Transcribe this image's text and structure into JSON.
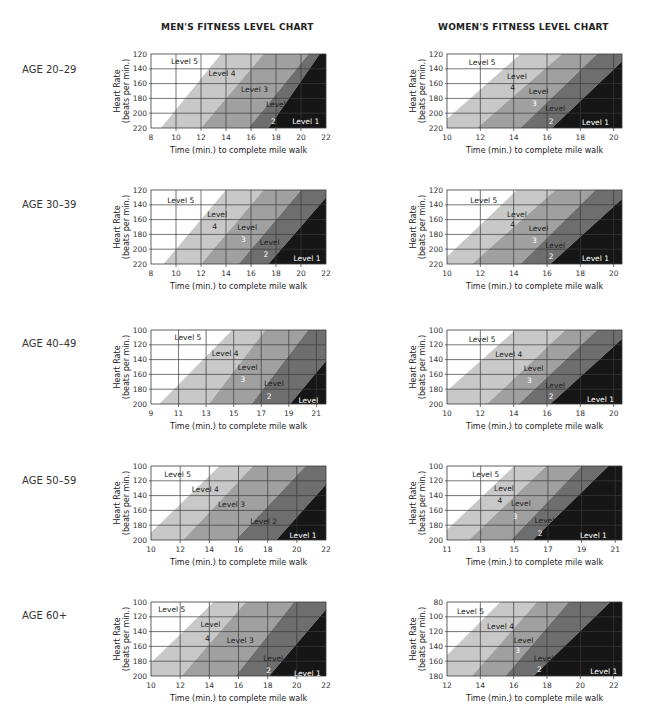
{
  "titles": {
    "men": "MEN'S FITNESS LEVEL CHART",
    "women": "WOMEN'S FITNESS LEVEL CHART"
  },
  "ages": [
    "AGE 20–29",
    "AGE 30–39",
    "AGE 40–49",
    "AGE 50–59",
    "AGE 60+"
  ],
  "axis": {
    "ylabel1": "Heart Rate",
    "ylabel2": "(beats per min.)",
    "xlabel": "Time (min.) to complete mile walk"
  },
  "colors": {
    "level5": "#ffffff",
    "level4": "#c8c8c8",
    "level3": "#a0a0a0",
    "level2": "#6e6e6e",
    "level1": "#161616",
    "grid": "#3a3a3a"
  },
  "chart_data": [
    {
      "id": "men-20-29",
      "group": "men",
      "age": "AGE 20–29",
      "type": "area",
      "title": "MEN'S FITNESS LEVEL CHART",
      "xlabel": "Time (min.) to complete mile walk",
      "ylabel": "Heart Rate (beats per min.)",
      "xticks": [
        8,
        10,
        12,
        14,
        16,
        18,
        20,
        22
      ],
      "yticks": [
        120,
        140,
        160,
        180,
        200,
        220
      ],
      "xlim": [
        8,
        22
      ],
      "ylim": [
        120,
        220
      ],
      "boundaries": [
        [
          [
            8.8,
            220
          ],
          [
            13.6,
            120
          ]
        ],
        [
          [
            12,
            220
          ],
          [
            17,
            120
          ]
        ],
        [
          [
            15.8,
            220
          ],
          [
            20.6,
            120
          ]
        ],
        [
          [
            17.4,
            220
          ],
          [
            21.5,
            120
          ]
        ]
      ],
      "labels": [
        {
          "text": "Level 5",
          "x": 9.6,
          "y": 130
        },
        {
          "text": "Level 4",
          "x": 12.6,
          "y": 145
        },
        {
          "text": "Level 3",
          "x": 15.2,
          "y": 167
        },
        {
          "text": "Level",
          "x": 17.2,
          "y": 188
        },
        {
          "text": "2",
          "x": 17.6,
          "y": 210
        },
        {
          "text": "Level 1",
          "x": 19.3,
          "y": 210,
          "light": true
        }
      ]
    },
    {
      "id": "women-20-29",
      "group": "women",
      "age": "AGE 20–29",
      "type": "area",
      "title": "WOMEN'S FITNESS LEVEL CHART",
      "xlabel": "Time (min.) to complete mile walk",
      "ylabel": "Heart Rate (beats per min.)",
      "xticks": [
        10,
        12,
        14,
        16,
        18,
        20
      ],
      "yticks": [
        120,
        140,
        160,
        180,
        200,
        220
      ],
      "xlim": [
        10,
        20.5
      ],
      "ylim": [
        120,
        220
      ],
      "boundaries": [
        [
          [
            10,
            208
          ],
          [
            14.4,
            120
          ]
        ],
        [
          [
            11.8,
            220
          ],
          [
            16.9,
            120
          ]
        ],
        [
          [
            14.4,
            220
          ],
          [
            19,
            120
          ]
        ],
        [
          [
            16.3,
            220
          ],
          [
            20.5,
            130
          ]
        ]
      ],
      "labels": [
        {
          "text": "Level 5",
          "x": 11.3,
          "y": 131
        },
        {
          "text": "Level",
          "x": 13.6,
          "y": 150
        },
        {
          "text": "4",
          "x": 13.8,
          "y": 164
        },
        {
          "text": "Level",
          "x": 14.9,
          "y": 170
        },
        {
          "text": "3",
          "x": 15.1,
          "y": 186
        },
        {
          "text": "Level",
          "x": 15.9,
          "y": 193
        },
        {
          "text": "2",
          "x": 16.1,
          "y": 210
        },
        {
          "text": "Level 1",
          "x": 18.1,
          "y": 212,
          "light": true
        }
      ]
    },
    {
      "id": "men-30-39",
      "group": "men",
      "age": "AGE 30–39",
      "type": "area",
      "xticks": [
        8,
        10,
        12,
        14,
        16,
        18,
        20,
        22
      ],
      "yticks": [
        120,
        140,
        160,
        180,
        200,
        220
      ],
      "xlim": [
        8,
        22
      ],
      "ylim": [
        120,
        220
      ],
      "boundaries": [
        [
          [
            9,
            220
          ],
          [
            14,
            120
          ]
        ],
        [
          [
            12,
            220
          ],
          [
            17,
            120
          ]
        ],
        [
          [
            15,
            220
          ],
          [
            20,
            120
          ]
        ],
        [
          [
            17.4,
            220
          ],
          [
            22,
            130
          ]
        ]
      ],
      "labels": [
        {
          "text": "Level 5",
          "x": 9.3,
          "y": 133
        },
        {
          "text": "Level",
          "x": 12.5,
          "y": 152
        },
        {
          "text": "4",
          "x": 12.9,
          "y": 168
        },
        {
          "text": "Level",
          "x": 14.9,
          "y": 170
        },
        {
          "text": "3",
          "x": 15.2,
          "y": 186
        },
        {
          "text": "Level",
          "x": 16.7,
          "y": 190
        },
        {
          "text": "2",
          "x": 17,
          "y": 207
        },
        {
          "text": "Level 1",
          "x": 19.4,
          "y": 212,
          "light": true
        }
      ]
    },
    {
      "id": "women-30-39",
      "group": "women",
      "age": "AGE 30–39",
      "type": "area",
      "xticks": [
        10,
        12,
        14,
        16,
        18,
        20
      ],
      "yticks": [
        120,
        140,
        160,
        180,
        200,
        220
      ],
      "xlim": [
        10,
        20.5
      ],
      "ylim": [
        120,
        220
      ],
      "boundaries": [
        [
          [
            10,
            210
          ],
          [
            14.2,
            120
          ]
        ],
        [
          [
            11.5,
            220
          ],
          [
            16.5,
            120
          ]
        ],
        [
          [
            14.4,
            220
          ],
          [
            18.9,
            120
          ]
        ],
        [
          [
            16.2,
            220
          ],
          [
            20.5,
            132
          ]
        ]
      ],
      "labels": [
        {
          "text": "Level 5",
          "x": 11.4,
          "y": 133
        },
        {
          "text": "Level",
          "x": 13.6,
          "y": 152
        },
        {
          "text": "4",
          "x": 13.8,
          "y": 166
        },
        {
          "text": "Level",
          "x": 14.9,
          "y": 172
        },
        {
          "text": "3",
          "x": 15.1,
          "y": 188
        },
        {
          "text": "Level",
          "x": 15.9,
          "y": 194
        },
        {
          "text": "2",
          "x": 16.1,
          "y": 209
        },
        {
          "text": "Level 1",
          "x": 18.1,
          "y": 212,
          "light": true
        }
      ]
    },
    {
      "id": "men-40-49",
      "group": "men",
      "age": "AGE 40–49",
      "type": "area",
      "xticks": [
        9,
        11,
        13,
        15,
        17,
        19,
        21
      ],
      "yticks": [
        100,
        120,
        140,
        160,
        180,
        200
      ],
      "xlim": [
        9,
        21.7
      ],
      "ylim": [
        100,
        200
      ],
      "boundaries": [
        [
          [
            9.6,
            200
          ],
          [
            14.9,
            100
          ]
        ],
        [
          [
            13.2,
            200
          ],
          [
            17.3,
            100
          ]
        ],
        [
          [
            16.3,
            200
          ],
          [
            20.4,
            100
          ]
        ],
        [
          [
            19.1,
            200
          ],
          [
            21.7,
            142
          ]
        ]
      ],
      "labels": [
        {
          "text": "Level 5",
          "x": 10.7,
          "y": 110
        },
        {
          "text": "Level 4",
          "x": 13.4,
          "y": 131
        },
        {
          "text": "Level",
          "x": 15.3,
          "y": 150
        },
        {
          "text": "3",
          "x": 15.5,
          "y": 166
        },
        {
          "text": "Level",
          "x": 17.2,
          "y": 172
        },
        {
          "text": "2",
          "x": 17.4,
          "y": 189
        },
        {
          "text": "Level",
          "x": 19.7,
          "y": 195,
          "light": true
        }
      ]
    },
    {
      "id": "women-40-49",
      "group": "women",
      "age": "AGE 40–49",
      "type": "area",
      "xticks": [
        10,
        12,
        14,
        16,
        18,
        20
      ],
      "yticks": [
        100,
        120,
        140,
        160,
        180,
        200
      ],
      "xlim": [
        10,
        20.5
      ],
      "ylim": [
        100,
        200
      ],
      "boundaries": [
        [
          [
            10,
            182
          ],
          [
            14.1,
            100
          ]
        ],
        [
          [
            12.4,
            200
          ],
          [
            17.1,
            100
          ]
        ],
        [
          [
            14.3,
            200
          ],
          [
            19,
            100
          ]
        ],
        [
          [
            16.2,
            200
          ],
          [
            20.5,
            112
          ]
        ]
      ],
      "labels": [
        {
          "text": "Level 5",
          "x": 11.3,
          "y": 112
        },
        {
          "text": "Level 4",
          "x": 12.9,
          "y": 133
        },
        {
          "text": "Level",
          "x": 14.6,
          "y": 152
        },
        {
          "text": "3",
          "x": 14.8,
          "y": 168
        },
        {
          "text": "Level",
          "x": 15.9,
          "y": 174
        },
        {
          "text": "2",
          "x": 16.1,
          "y": 189
        },
        {
          "text": "Level 1",
          "x": 18.4,
          "y": 193,
          "light": true
        }
      ]
    },
    {
      "id": "men-50-59",
      "group": "men",
      "age": "AGE 50–59",
      "type": "area",
      "xticks": [
        10,
        12,
        14,
        16,
        18,
        20,
        22
      ],
      "yticks": [
        100,
        120,
        140,
        160,
        180,
        200
      ],
      "xlim": [
        10,
        22
      ],
      "ylim": [
        100,
        200
      ],
      "boundaries": [
        [
          [
            10,
            190
          ],
          [
            14.7,
            100
          ]
        ],
        [
          [
            12.2,
            200
          ],
          [
            17,
            100
          ]
        ],
        [
          [
            15.8,
            200
          ],
          [
            20.6,
            100
          ]
        ],
        [
          [
            18.6,
            200
          ],
          [
            22,
            125
          ]
        ]
      ],
      "labels": [
        {
          "text": "Level 5",
          "x": 10.9,
          "y": 111
        },
        {
          "text": "Level 4",
          "x": 12.8,
          "y": 131
        },
        {
          "text": "Level 3",
          "x": 14.6,
          "y": 152
        },
        {
          "text": "Level 2",
          "x": 16.8,
          "y": 174
        },
        {
          "text": "Level 1",
          "x": 19.5,
          "y": 193,
          "light": true
        }
      ]
    },
    {
      "id": "women-50-59",
      "group": "women",
      "age": "AGE 50–59",
      "type": "area",
      "xticks": [
        11,
        13,
        15,
        17,
        19,
        21
      ],
      "yticks": [
        100,
        120,
        140,
        160,
        180,
        200
      ],
      "xlim": [
        11,
        21.4
      ],
      "ylim": [
        100,
        200
      ],
      "boundaries": [
        [
          [
            11,
            186
          ],
          [
            15,
            100
          ]
        ],
        [
          [
            12.3,
            200
          ],
          [
            16.9,
            100
          ]
        ],
        [
          [
            14.8,
            200
          ],
          [
            19,
            100
          ]
        ],
        [
          [
            16.1,
            200
          ],
          [
            20.6,
            100
          ]
        ]
      ],
      "labels": [
        {
          "text": "Level 5",
          "x": 12.5,
          "y": 111
        },
        {
          "text": "Level",
          "x": 13.8,
          "y": 130
        },
        {
          "text": "4",
          "x": 14,
          "y": 146
        },
        {
          "text": "Level",
          "x": 14.8,
          "y": 150
        },
        {
          "text": "3",
          "x": 14.9,
          "y": 168
        },
        {
          "text": "Level",
          "x": 16.2,
          "y": 173
        },
        {
          "text": "2",
          "x": 16.4,
          "y": 190
        },
        {
          "text": "Level 1",
          "x": 18.9,
          "y": 193,
          "light": true
        }
      ]
    },
    {
      "id": "men-60plus",
      "group": "men",
      "age": "AGE 60+",
      "type": "area",
      "xticks": [
        10,
        12,
        14,
        16,
        18,
        20,
        22
      ],
      "yticks": [
        100,
        120,
        140,
        160,
        180,
        200
      ],
      "xlim": [
        10,
        22
      ],
      "ylim": [
        100,
        200
      ],
      "boundaries": [
        [
          [
            10,
            182
          ],
          [
            14.3,
            100
          ]
        ],
        [
          [
            12.1,
            200
          ],
          [
            16.5,
            100
          ]
        ],
        [
          [
            15.8,
            200
          ],
          [
            19.8,
            100
          ]
        ],
        [
          [
            18.1,
            200
          ],
          [
            22,
            110
          ]
        ]
      ],
      "labels": [
        {
          "text": "Level 5",
          "x": 10.5,
          "y": 110
        },
        {
          "text": "Level",
          "x": 13.4,
          "y": 130
        },
        {
          "text": "4",
          "x": 13.7,
          "y": 148
        },
        {
          "text": "Level 3",
          "x": 15.2,
          "y": 152
        },
        {
          "text": "Level",
          "x": 17.7,
          "y": 176
        },
        {
          "text": "2",
          "x": 17.9,
          "y": 192
        },
        {
          "text": "Level 1",
          "x": 19.8,
          "y": 196,
          "light": true
        }
      ]
    },
    {
      "id": "women-60plus",
      "group": "women",
      "age": "AGE 60+",
      "type": "area",
      "xticks": [
        12,
        14,
        16,
        18,
        20,
        22
      ],
      "yticks": [
        80,
        100,
        120,
        140,
        160,
        180
      ],
      "xlim": [
        12,
        22.5
      ],
      "ylim": [
        80,
        180
      ],
      "boundaries": [
        [
          [
            12,
            152
          ],
          [
            15.2,
            80
          ]
        ],
        [
          [
            13.5,
            180
          ],
          [
            17.4,
            80
          ]
        ],
        [
          [
            15.5,
            180
          ],
          [
            19.3,
            80
          ]
        ],
        [
          [
            17.2,
            180
          ],
          [
            21.8,
            80
          ]
        ]
      ],
      "labels": [
        {
          "text": "Level 5",
          "x": 12.6,
          "y": 92
        },
        {
          "text": "Level 4",
          "x": 14.4,
          "y": 113
        },
        {
          "text": "Level",
          "x": 16,
          "y": 132
        },
        {
          "text": "3",
          "x": 16.1,
          "y": 145
        },
        {
          "text": "Level",
          "x": 17.2,
          "y": 155
        },
        {
          "text": "2",
          "x": 17.4,
          "y": 170
        },
        {
          "text": "Level 1",
          "x": 20.6,
          "y": 173,
          "light": true
        }
      ]
    }
  ]
}
